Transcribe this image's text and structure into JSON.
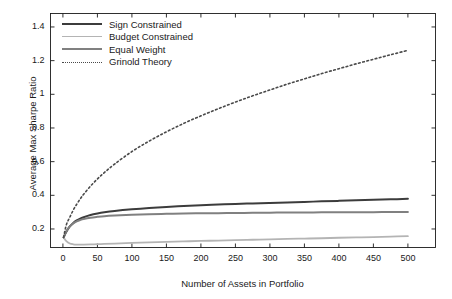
{
  "chart_data": {
    "type": "line",
    "title": "",
    "xlabel": "Number of Assets in Portfolio",
    "ylabel": "Average Max Sharpe Ratio",
    "xlim": [
      -18,
      540
    ],
    "ylim": [
      0.09,
      1.48
    ],
    "grid": false,
    "legend_position": "upper left",
    "xticks": [
      0,
      50,
      100,
      150,
      200,
      250,
      300,
      350,
      400,
      450,
      500
    ],
    "yticks": [
      0.2,
      0.4,
      0.6,
      0.8,
      1,
      1.2,
      1.4
    ],
    "xtick_labels": [
      "0",
      "50",
      "100",
      "150",
      "200",
      "250",
      "300",
      "350",
      "400",
      "450",
      "500"
    ],
    "ytick_labels": [
      "0.2",
      "0.4",
      "0.6",
      "0.8",
      "1",
      "1.2",
      "1.4"
    ],
    "x": [
      1,
      5,
      10,
      15,
      20,
      25,
      30,
      40,
      50,
      60,
      75,
      100,
      125,
      150,
      175,
      200,
      225,
      250,
      275,
      300,
      325,
      350,
      375,
      400,
      425,
      450,
      475,
      500
    ],
    "series": [
      {
        "name": "Sign Constrained",
        "color": "#3c3c3c",
        "style": "solid",
        "width": 2.0,
        "values": [
          0.15,
          0.183,
          0.215,
          0.236,
          0.251,
          0.262,
          0.27,
          0.283,
          0.292,
          0.299,
          0.307,
          0.317,
          0.325,
          0.331,
          0.336,
          0.341,
          0.345,
          0.349,
          0.352,
          0.355,
          0.358,
          0.361,
          0.364,
          0.367,
          0.37,
          0.373,
          0.376,
          0.379
        ]
      },
      {
        "name": "Budget Constrained",
        "color": "#b4b4b4",
        "style": "solid",
        "width": 1.8,
        "values": [
          0.15,
          0.128,
          0.114,
          0.109,
          0.107,
          0.107,
          0.107,
          0.108,
          0.11,
          0.111,
          0.113,
          0.117,
          0.12,
          0.123,
          0.126,
          0.129,
          0.131,
          0.134,
          0.136,
          0.138,
          0.141,
          0.143,
          0.145,
          0.148,
          0.15,
          0.152,
          0.155,
          0.157
        ]
      },
      {
        "name": "Equal Weight",
        "color": "#808080",
        "style": "solid",
        "width": 2.0,
        "values": [
          0.15,
          0.186,
          0.215,
          0.233,
          0.245,
          0.253,
          0.259,
          0.267,
          0.272,
          0.276,
          0.28,
          0.285,
          0.288,
          0.29,
          0.292,
          0.293,
          0.294,
          0.295,
          0.296,
          0.297,
          0.298,
          0.298,
          0.299,
          0.299,
          0.3,
          0.3,
          0.301,
          0.301
        ]
      },
      {
        "name": "Grinold Theory",
        "color": "#4a4a4a",
        "style": "dotted",
        "width": 1.6,
        "values": [
          0.15,
          0.225,
          0.27,
          0.312,
          0.347,
          0.378,
          0.406,
          0.455,
          0.497,
          0.535,
          0.586,
          0.66,
          0.722,
          0.777,
          0.827,
          0.872,
          0.914,
          0.954,
          0.991,
          1.026,
          1.06,
          1.092,
          1.123,
          1.152,
          1.181,
          1.208,
          1.235,
          1.261
        ]
      }
    ]
  },
  "legend": {
    "items": [
      {
        "label": "Sign Constrained"
      },
      {
        "label": "Budget Constrained"
      },
      {
        "label": "Equal Weight"
      },
      {
        "label": "Grinold Theory"
      }
    ]
  },
  "axes": {
    "x_title": "Number of Assets in Portfolio",
    "y_title": "Average Max Sharpe Ratio"
  },
  "colors": {
    "axis": "#1a1a1a",
    "background": "#ffffff"
  }
}
